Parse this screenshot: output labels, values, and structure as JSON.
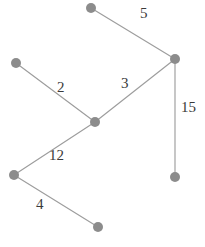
{
  "figure": {
    "title": "",
    "background_color": "#ffffff",
    "node_color": "#8c8c8c",
    "edge_color": "#9d9d9d",
    "label_color": "#3a3a3a",
    "width": 205,
    "height": 247
  },
  "chart_data": {
    "type": "diagram",
    "diagram_kind": "weighted-graph",
    "title": "",
    "xlabel": "",
    "ylabel": "",
    "grid": false,
    "legend": null,
    "node_radius": 5,
    "nodes": [
      {
        "id": "n1",
        "label": "",
        "x": 91,
        "y": 8
      },
      {
        "id": "n2",
        "label": "",
        "x": 175,
        "y": 59
      },
      {
        "id": "n3",
        "label": "",
        "x": 16,
        "y": 63
      },
      {
        "id": "n4",
        "label": "",
        "x": 95,
        "y": 122
      },
      {
        "id": "n5",
        "label": "",
        "x": 175,
        "y": 177
      },
      {
        "id": "n6",
        "label": "",
        "x": 14,
        "y": 175
      },
      {
        "id": "n7",
        "label": "",
        "x": 98,
        "y": 227
      }
    ],
    "edges": [
      {
        "source": "n1",
        "target": "n2",
        "weight": "5",
        "label_x": 140,
        "label_y": 6
      },
      {
        "source": "n3",
        "target": "n4",
        "weight": "2",
        "label_x": 57,
        "label_y": 80
      },
      {
        "source": "n4",
        "target": "n2",
        "weight": "3",
        "label_x": 121,
        "label_y": 76
      },
      {
        "source": "n2",
        "target": "n5",
        "weight": "15",
        "label_x": 181,
        "label_y": 100
      },
      {
        "source": "n6",
        "target": "n4",
        "weight": "12",
        "label_x": 49,
        "label_y": 148
      },
      {
        "source": "n6",
        "target": "n7",
        "weight": "4",
        "label_x": 36,
        "label_y": 197
      }
    ]
  }
}
